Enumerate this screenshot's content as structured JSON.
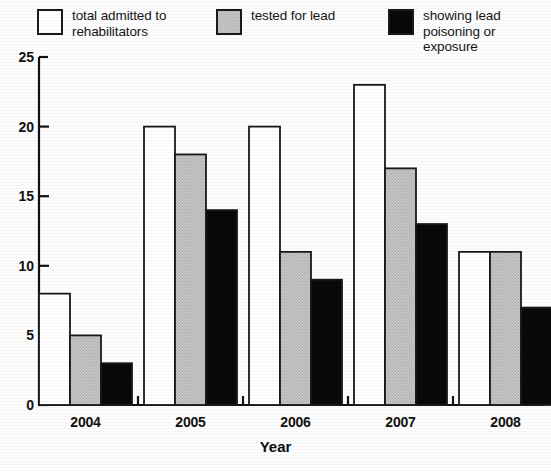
{
  "legend": {
    "entries": [
      {
        "label": "total admitted to\nrehabilitators",
        "swatch": "white-square-icon"
      },
      {
        "label": "tested for lead",
        "swatch": "gray-square-icon"
      },
      {
        "label": "showing lead\npoisoning or exposure",
        "swatch": "black-square-icon"
      }
    ]
  },
  "axis": {
    "x_title": "Year",
    "y_ticks": [
      "25",
      "20",
      "15",
      "10",
      "5",
      "0"
    ],
    "x_ticks": [
      "2004",
      "2005",
      "2006",
      "2007",
      "2008"
    ]
  },
  "colors": {
    "series_1": "#ffffff",
    "series_2": "#c9c9c9",
    "series_3": "#080808",
    "outline": "#1a1a1a",
    "axis": "#111111"
  },
  "chart_data": {
    "type": "bar",
    "title": "",
    "xlabel": "Year",
    "ylabel": "",
    "categories": [
      "2004",
      "2005",
      "2006",
      "2007",
      "2008"
    ],
    "series": [
      {
        "name": "total admitted to rehabilitators",
        "values": [
          8,
          20,
          20,
          23,
          11
        ],
        "color": "#ffffff"
      },
      {
        "name": "tested for lead",
        "values": [
          5,
          18,
          11,
          17,
          11
        ],
        "color": "#c9c9c9"
      },
      {
        "name": "showing lead poisoning or exposure",
        "values": [
          3,
          14,
          9,
          13,
          7
        ],
        "color": "#080808"
      }
    ],
    "ylim": [
      0,
      25
    ],
    "ytick_step": 5,
    "grid": false,
    "legend_position": "top"
  }
}
